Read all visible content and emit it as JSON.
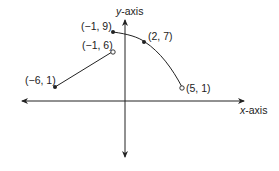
{
  "axes": {
    "x_label_var": "x",
    "x_label_rest": "-axis",
    "y_label_var": "y",
    "y_label_rest": "-axis"
  },
  "points": [
    {
      "label": "(−6, 1)",
      "x": -6,
      "y": 1,
      "filled": true
    },
    {
      "label": "(−1, 6)",
      "x": -1,
      "y": 6,
      "filled": false
    },
    {
      "label": "(−1, 9)",
      "x": -1,
      "y": 9,
      "filled": true
    },
    {
      "label": "(2, 7)",
      "x": 2,
      "y": 7,
      "filled": true
    },
    {
      "label": "(5, 1)",
      "x": 5,
      "y": 1,
      "filled": false
    }
  ],
  "segments": [
    {
      "type": "line",
      "from": [
        -6,
        1
      ],
      "to": [
        -1,
        6
      ]
    },
    {
      "type": "curve",
      "from": [
        -1,
        9
      ],
      "through": [
        2,
        7
      ],
      "to": [
        5,
        1
      ]
    }
  ],
  "colors": {
    "ink": "#222222",
    "background": "#ffffff"
  }
}
